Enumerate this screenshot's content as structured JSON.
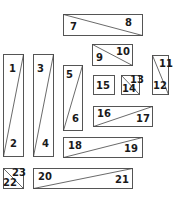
{
  "diagram": {
    "type": "cutting-layout",
    "colors": {
      "stroke": "#555555",
      "fill": "#ffffff",
      "text": "#1a1a1a"
    },
    "pieces": [
      {
        "id": "p1",
        "x": 3,
        "y": 54,
        "w": 20,
        "h": 102,
        "diag": "tr-bl",
        "labels": [
          {
            "text": "1",
            "x": 9,
            "y": 72
          },
          {
            "text": "2",
            "x": 10,
            "y": 147
          }
        ]
      },
      {
        "id": "p2",
        "x": 33,
        "y": 54,
        "w": 20,
        "h": 102,
        "diag": "tr-bl",
        "labels": [
          {
            "text": "3",
            "x": 37,
            "y": 72
          },
          {
            "text": "4",
            "x": 42,
            "y": 147
          }
        ]
      },
      {
        "id": "p3",
        "x": 63,
        "y": 14,
        "w": 79,
        "h": 21,
        "diag": "tl-br",
        "labels": [
          {
            "text": "7",
            "x": 70,
            "y": 30
          },
          {
            "text": "8",
            "x": 125,
            "y": 26
          }
        ]
      },
      {
        "id": "p4",
        "x": 63,
        "y": 65,
        "w": 19,
        "h": 65,
        "diag": "tr-bl",
        "labels": [
          {
            "text": "5",
            "x": 66,
            "y": 78
          },
          {
            "text": "6",
            "x": 72,
            "y": 122
          }
        ]
      },
      {
        "id": "p5",
        "x": 92,
        "y": 44,
        "w": 40,
        "h": 21,
        "diag": "tl-br",
        "labels": [
          {
            "text": "9",
            "x": 96,
            "y": 61
          },
          {
            "text": "10",
            "x": 116,
            "y": 55
          }
        ]
      },
      {
        "id": "p6",
        "x": 152,
        "y": 55,
        "w": 16,
        "h": 39,
        "diag": "tl-br",
        "labels": [
          {
            "text": "11",
            "x": 159,
            "y": 67
          },
          {
            "text": "12",
            "x": 153,
            "y": 89
          }
        ]
      },
      {
        "id": "p7",
        "x": 93,
        "y": 75,
        "w": 21,
        "h": 19,
        "diag": "none",
        "labels": [
          {
            "text": "15",
            "x": 96,
            "y": 89
          }
        ]
      },
      {
        "id": "p8",
        "x": 121,
        "y": 75,
        "w": 18,
        "h": 19,
        "diag": "tl-br",
        "labels": [
          {
            "text": "13",
            "x": 130,
            "y": 83
          },
          {
            "text": "14",
            "x": 122,
            "y": 92
          }
        ]
      },
      {
        "id": "p9",
        "x": 93,
        "y": 106,
        "w": 59,
        "h": 20,
        "diag": "tr-bl",
        "labels": [
          {
            "text": "16",
            "x": 97,
            "y": 117
          },
          {
            "text": "17",
            "x": 136,
            "y": 122
          }
        ]
      },
      {
        "id": "p10",
        "x": 63,
        "y": 137,
        "w": 79,
        "h": 20,
        "diag": "tr-bl",
        "labels": [
          {
            "text": "18",
            "x": 68,
            "y": 149
          },
          {
            "text": "19",
            "x": 124,
            "y": 152
          }
        ]
      },
      {
        "id": "p11",
        "x": 3,
        "y": 168,
        "w": 20,
        "h": 20,
        "diag": "tl-br",
        "labels": [
          {
            "text": "23",
            "x": 12,
            "y": 176
          },
          {
            "text": "22",
            "x": 3,
            "y": 186
          }
        ]
      },
      {
        "id": "p12",
        "x": 33,
        "y": 168,
        "w": 99,
        "h": 20,
        "diag": "tr-bl",
        "labels": [
          {
            "text": "20",
            "x": 38,
            "y": 180
          },
          {
            "text": "21",
            "x": 115,
            "y": 183
          }
        ]
      }
    ]
  }
}
